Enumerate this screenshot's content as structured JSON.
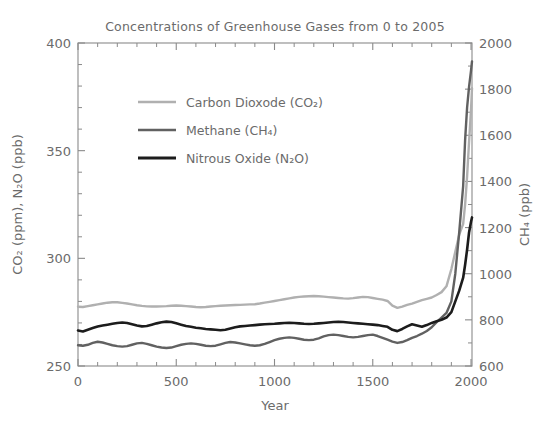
{
  "chart_data": {
    "type": "line",
    "title": "Concentrations of Greenhouse Gases from 0 to 2005",
    "xlabel": "Year",
    "ylabel_left": "CO₂ (ppm), N₂O (ppb)",
    "ylabel_right": "CH₄ (ppb)",
    "xlim": [
      0,
      2005
    ],
    "ylim_left": [
      250,
      400
    ],
    "ylim_right": [
      600,
      2000
    ],
    "xticks": [
      0,
      500,
      1000,
      1500,
      2000
    ],
    "xtick_labels": [
      "0",
      "500",
      "1000",
      "1500",
      "2000"
    ],
    "yticks_left": [
      250,
      300,
      350,
      400
    ],
    "ytick_labels_left": [
      "250",
      "300",
      "350",
      "400"
    ],
    "yticks_right": [
      600,
      800,
      1000,
      1200,
      1400,
      1600,
      1800,
      2000
    ],
    "ytick_labels_right": [
      "600",
      "800",
      "1000",
      "1200",
      "1400",
      "1600",
      "1800",
      "2000"
    ],
    "minor_ticks_x": 100,
    "minor_ticks_y_left": 10,
    "minor_ticks_y_right": 100,
    "grid": false,
    "legend_position": "upper-left-inside",
    "series": [
      {
        "name": "Carbon Dioxode (CO₂)",
        "axis": "left",
        "unit": "ppm",
        "color": "#b0b0b0",
        "width": 2.4,
        "x": [
          0,
          25,
          50,
          75,
          100,
          125,
          150,
          175,
          200,
          225,
          250,
          275,
          300,
          325,
          350,
          375,
          400,
          425,
          450,
          475,
          500,
          525,
          550,
          575,
          600,
          625,
          650,
          675,
          700,
          725,
          750,
          775,
          800,
          825,
          850,
          875,
          900,
          925,
          950,
          975,
          1000,
          1025,
          1050,
          1075,
          1100,
          1125,
          1150,
          1175,
          1200,
          1225,
          1250,
          1275,
          1300,
          1325,
          1350,
          1375,
          1400,
          1425,
          1450,
          1475,
          1500,
          1525,
          1550,
          1575,
          1600,
          1625,
          1650,
          1675,
          1700,
          1725,
          1750,
          1775,
          1800,
          1825,
          1850,
          1875,
          1900,
          1920,
          1940,
          1960,
          1970,
          1980,
          1990,
          2000,
          2005
        ],
        "y": [
          277.5,
          277.4,
          277.8,
          278.2,
          278.6,
          279.0,
          279.4,
          279.6,
          279.6,
          279.3,
          279.0,
          278.6,
          278.2,
          277.9,
          277.7,
          277.6,
          277.6,
          277.7,
          277.8,
          278.0,
          278.1,
          278.0,
          277.8,
          277.6,
          277.4,
          277.3,
          277.4,
          277.6,
          277.8,
          278.0,
          278.1,
          278.2,
          278.3,
          278.4,
          278.5,
          278.6,
          278.7,
          279.0,
          279.4,
          279.8,
          280.2,
          280.6,
          281.0,
          281.4,
          281.8,
          282.1,
          282.3,
          282.4,
          282.5,
          282.4,
          282.2,
          282.0,
          281.8,
          281.6,
          281.4,
          281.3,
          281.5,
          281.8,
          282.1,
          282.0,
          281.6,
          281.2,
          280.8,
          280.2,
          278.0,
          277.0,
          277.6,
          278.4,
          279.0,
          279.8,
          280.6,
          281.2,
          281.8,
          283.0,
          284.3,
          287.0,
          295.0,
          303.0,
          311.0,
          316.0,
          325.0,
          338.0,
          354.0,
          369.0,
          379.0
        ]
      },
      {
        "name": "Methane (CH₄)",
        "axis": "right",
        "unit": "ppb",
        "color": "#616161",
        "width": 2.4,
        "x": [
          0,
          25,
          50,
          75,
          100,
          125,
          150,
          175,
          200,
          225,
          250,
          275,
          300,
          325,
          350,
          375,
          400,
          425,
          450,
          475,
          500,
          525,
          550,
          575,
          600,
          625,
          650,
          675,
          700,
          725,
          750,
          775,
          800,
          825,
          850,
          875,
          900,
          925,
          950,
          975,
          1000,
          1025,
          1050,
          1075,
          1100,
          1125,
          1150,
          1175,
          1200,
          1225,
          1250,
          1275,
          1300,
          1325,
          1350,
          1375,
          1400,
          1425,
          1450,
          1475,
          1500,
          1525,
          1550,
          1575,
          1600,
          1625,
          1650,
          1675,
          1700,
          1725,
          1750,
          1775,
          1800,
          1825,
          1850,
          1875,
          1900,
          1920,
          1940,
          1960,
          1970,
          1980,
          1990,
          2000,
          2005
        ],
        "y": [
          690,
          688,
          692,
          700,
          705,
          702,
          696,
          690,
          686,
          684,
          686,
          692,
          698,
          700,
          696,
          690,
          684,
          680,
          678,
          680,
          686,
          692,
          696,
          698,
          696,
          692,
          688,
          686,
          688,
          694,
          700,
          704,
          702,
          698,
          694,
          690,
          688,
          690,
          696,
          704,
          712,
          718,
          722,
          724,
          722,
          718,
          714,
          712,
          714,
          720,
          728,
          734,
          736,
          734,
          730,
          726,
          724,
          726,
          730,
          734,
          736,
          730,
          722,
          714,
          706,
          700,
          704,
          712,
          722,
          730,
          740,
          752,
          768,
          790,
          810,
          830,
          880,
          1000,
          1180,
          1380,
          1580,
          1720,
          1810,
          1880,
          1920
        ]
      },
      {
        "name": "Nitrous Oxide (N₂O)",
        "axis": "left",
        "unit": "ppb",
        "color": "#1c1c1c",
        "width": 2.6,
        "x": [
          0,
          25,
          50,
          75,
          100,
          125,
          150,
          175,
          200,
          225,
          250,
          275,
          300,
          325,
          350,
          375,
          400,
          425,
          450,
          475,
          500,
          525,
          550,
          575,
          600,
          625,
          650,
          675,
          700,
          725,
          750,
          775,
          800,
          825,
          850,
          875,
          900,
          925,
          950,
          975,
          1000,
          1025,
          1050,
          1075,
          1100,
          1125,
          1150,
          1175,
          1200,
          1225,
          1250,
          1275,
          1300,
          1325,
          1350,
          1375,
          1400,
          1425,
          1450,
          1475,
          1500,
          1525,
          1550,
          1575,
          1600,
          1625,
          1650,
          1675,
          1700,
          1725,
          1750,
          1775,
          1800,
          1825,
          1850,
          1875,
          1900,
          1920,
          1940,
          1960,
          1970,
          1980,
          1990,
          2000,
          2005
        ],
        "y": [
          266.5,
          266.0,
          266.8,
          267.6,
          268.3,
          268.8,
          269.2,
          269.6,
          270.0,
          270.2,
          270.0,
          269.4,
          268.8,
          268.4,
          268.6,
          269.2,
          269.8,
          270.3,
          270.6,
          270.4,
          269.8,
          269.2,
          268.6,
          268.2,
          267.8,
          267.5,
          267.2,
          267.0,
          266.8,
          266.6,
          266.8,
          267.4,
          268.0,
          268.4,
          268.6,
          268.8,
          269.0,
          269.2,
          269.4,
          269.5,
          269.6,
          269.8,
          270.0,
          270.1,
          270.0,
          269.8,
          269.6,
          269.5,
          269.6,
          269.8,
          270.0,
          270.2,
          270.4,
          270.5,
          270.4,
          270.2,
          270.0,
          269.8,
          269.6,
          269.4,
          269.2,
          269.0,
          268.6,
          268.2,
          266.8,
          266.2,
          267.2,
          268.4,
          269.4,
          268.8,
          268.2,
          269.0,
          270.0,
          270.8,
          271.5,
          272.5,
          275.0,
          280.0,
          285.0,
          291.0,
          297.0,
          304.0,
          312.0,
          317.0,
          319.0
        ]
      }
    ]
  },
  "legend": {
    "items": [
      {
        "label": "Carbon Dioxode (CO₂)",
        "color": "#b0b0b0"
      },
      {
        "label": "Methane (CH₄)",
        "color": "#616161"
      },
      {
        "label": "Nitrous Oxide (N₂O)",
        "color": "#1c1c1c"
      }
    ]
  }
}
